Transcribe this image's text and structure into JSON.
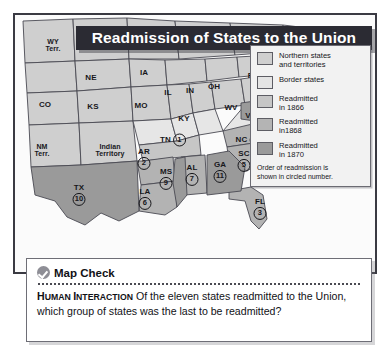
{
  "figure": {
    "title": "Readmission of States to the Union"
  },
  "legend": {
    "items": [
      {
        "label_line1": "Northern states",
        "label_line2": "and territories",
        "color": "#cfcfcf"
      },
      {
        "label_line1": "Border states",
        "label_line2": "",
        "color": "#e4e4e4"
      },
      {
        "label_line1": "Readmitted",
        "label_line2": "in 1866",
        "color": "#c6c6c6"
      },
      {
        "label_line1": "Readmitted",
        "label_line2": "in1868",
        "color": "#b4b4b4"
      },
      {
        "label_line1": "Readmitted",
        "label_line2": "in 1870",
        "color": "#9a9a9a"
      }
    ],
    "note_line1": "Order of readmission is",
    "note_line2": "shown in circled number."
  },
  "map": {
    "labels": [
      {
        "name": "WY Terr.",
        "line1": "WY",
        "line2": "Terr.",
        "x": 38,
        "y": 30,
        "num": ""
      },
      {
        "name": "NE",
        "line1": "NE",
        "line2": "",
        "x": 76,
        "y": 63,
        "num": ""
      },
      {
        "name": "IA",
        "line1": "IA",
        "line2": "",
        "x": 129,
        "y": 58,
        "num": ""
      },
      {
        "name": "CO",
        "line1": "CO",
        "line2": "",
        "x": 30,
        "y": 90,
        "num": ""
      },
      {
        "name": "KS",
        "line1": "KS",
        "line2": "",
        "x": 78,
        "y": 92,
        "num": ""
      },
      {
        "name": "MO",
        "line1": "MO",
        "line2": "",
        "x": 126,
        "y": 91,
        "num": ""
      },
      {
        "name": "IL",
        "line1": "IL",
        "line2": "",
        "x": 153,
        "y": 78,
        "num": ""
      },
      {
        "name": "IN",
        "line1": "IN",
        "line2": "",
        "x": 175,
        "y": 76,
        "num": ""
      },
      {
        "name": "OH",
        "line1": "OH",
        "line2": "",
        "x": 199,
        "y": 72,
        "num": ""
      },
      {
        "name": "PA",
        "line1": "PA",
        "line2": "",
        "x": 238,
        "y": 61,
        "num": ""
      },
      {
        "name": "KY",
        "line1": "KY",
        "line2": "",
        "x": 169,
        "y": 104,
        "num": ""
      },
      {
        "name": "WV",
        "line1": "WV",
        "line2": "",
        "x": 216,
        "y": 93,
        "num": ""
      },
      {
        "name": "NM Terr.",
        "line1": "NM",
        "line2": "Terr.",
        "x": 27,
        "y": 135,
        "num": ""
      },
      {
        "name": "Indian Territory",
        "line1": "Indian",
        "line2": "Territory",
        "x": 95,
        "y": 135,
        "num": ""
      }
    ],
    "numbered": [
      {
        "name": "VA",
        "label": "VA",
        "num": "8",
        "x": 243,
        "y": 101,
        "inline": true
      },
      {
        "name": "TN",
        "label": "TN",
        "num": "1",
        "x": 158,
        "y": 125,
        "inline": true
      },
      {
        "name": "NC",
        "label": "NC",
        "num": "4",
        "x": 234,
        "y": 125,
        "inline": true
      },
      {
        "name": "AR",
        "label": "AR",
        "num": "2",
        "x": 129,
        "y": 144,
        "inline": false
      },
      {
        "name": "SC",
        "label": "SC",
        "num": "5",
        "x": 229,
        "y": 146,
        "inline": false
      },
      {
        "name": "MS",
        "label": "MS",
        "num": "9",
        "x": 151,
        "y": 164,
        "inline": false
      },
      {
        "name": "AL",
        "label": "AL",
        "num": "7",
        "x": 177,
        "y": 160,
        "inline": false
      },
      {
        "name": "GA",
        "label": "GA",
        "num": "11",
        "x": 205,
        "y": 157,
        "inline": false
      },
      {
        "name": "LA",
        "label": "LA",
        "num": "6",
        "x": 130,
        "y": 184,
        "inline": false
      },
      {
        "name": "TX",
        "label": "TX",
        "num": "10",
        "x": 64,
        "y": 180,
        "inline": false
      },
      {
        "name": "FL",
        "label": "FL",
        "num": "3",
        "x": 245,
        "y": 194,
        "inline": false
      }
    ],
    "pointer_labels": [
      {
        "name": "NJ",
        "label": "NJ",
        "x": 275,
        "y": 74
      },
      {
        "name": "DE",
        "label": "DE",
        "x": 275,
        "y": 84
      },
      {
        "name": "MD",
        "label": "MD",
        "x": 275,
        "y": 94
      }
    ]
  },
  "map_check": {
    "title": "Map Check",
    "prompt_caps_first": "H",
    "prompt_caps_rest": "UMAN ",
    "prompt_caps2_first": "I",
    "prompt_caps2_rest": "NTERACTION",
    "prompt_body": " Of the eleven states readmitted to the Union, which group of states was the last to be readmitted?"
  }
}
